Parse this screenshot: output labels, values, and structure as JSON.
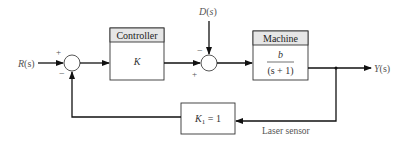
{
  "diagram": {
    "type": "feedback-control-block-diagram",
    "input": {
      "label": "R(s)"
    },
    "disturbance": {
      "label": "D(s)"
    },
    "output": {
      "label": "Y(s)"
    },
    "sum1": {
      "sign_top": "+",
      "sign_bottom": "−"
    },
    "sum2": {
      "sign_top": "−",
      "sign_bottom": "+"
    },
    "controller": {
      "header": "Controller",
      "body": "K"
    },
    "machine": {
      "header": "Machine",
      "numerator": "b",
      "denominator": "(s + 1)"
    },
    "feedback": {
      "body_main": "K",
      "body_sub": "1",
      "body_rest": " = 1",
      "caption": "Laser sensor"
    },
    "colors": {
      "line": "#111111",
      "header_fill": "#e6e6e6",
      "text": "#444444"
    }
  }
}
